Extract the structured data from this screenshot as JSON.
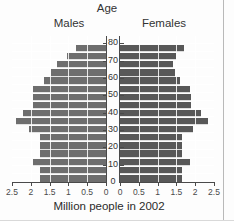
{
  "titles": {
    "top": "Age",
    "left_panel": "Males",
    "right_panel": "Females",
    "xaxis": "Million people in 2002"
  },
  "colors": {
    "male_bar": "#6e6e6e",
    "female_bar": "#585858",
    "gridline": "#ffffff",
    "axis": "#4a4a4a",
    "background": "#fdfdfd",
    "text": "#333333"
  },
  "axis": {
    "x_left_ticks": [
      "2.5",
      "2",
      "1.5",
      "1",
      "0.5",
      "0"
    ],
    "x_right_ticks": [
      "0",
      "0.5",
      "1",
      "1.5",
      "2",
      "2.5"
    ],
    "x_max": 2.5,
    "y_ticks": [
      "0",
      "10",
      "20",
      "30",
      "40",
      "50",
      "60",
      "70",
      "80"
    ],
    "y_min": 0,
    "y_max": 85,
    "grid": true
  },
  "chart_data": {
    "type": "bar",
    "title": "Age",
    "xlabel": "Million people in 2002",
    "ylabel": "Age",
    "xlim": [
      0,
      2.5
    ],
    "ylim": [
      0,
      85
    ],
    "orientation": "population-pyramid",
    "categories": [
      "0-5",
      "5-10",
      "10-15",
      "15-20",
      "20-25",
      "25-30",
      "30-35",
      "35-40",
      "40-45",
      "45-50",
      "50-55",
      "55-60",
      "60-65",
      "65-70",
      "70-75",
      "75-80",
      "80+"
    ],
    "series": [
      {
        "name": "Males",
        "direction": "left",
        "values": [
          1.75,
          1.75,
          1.95,
          1.75,
          1.75,
          1.75,
          2.05,
          2.4,
          2.2,
          1.95,
          1.95,
          1.95,
          1.65,
          1.45,
          1.3,
          1.05,
          0.8
        ]
      },
      {
        "name": "Females",
        "direction": "right",
        "values": [
          1.65,
          1.65,
          1.85,
          1.65,
          1.65,
          1.65,
          1.95,
          2.35,
          2.15,
          1.9,
          1.9,
          1.85,
          1.6,
          1.45,
          1.4,
          1.5,
          1.7
        ]
      }
    ],
    "legend": [
      "Males",
      "Females"
    ],
    "legend_position": "panel-headers"
  }
}
